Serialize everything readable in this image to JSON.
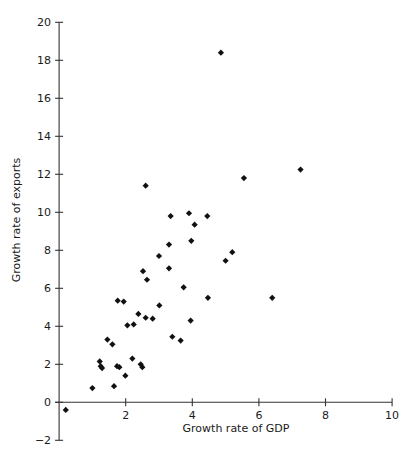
{
  "chart_data": {
    "type": "scatter",
    "title": "",
    "xlabel": "Growth rate of GDP",
    "ylabel": "Growth rate of exports",
    "xlim": [
      0,
      10
    ],
    "ylim": [
      -2,
      20
    ],
    "xticks": [
      0,
      2,
      4,
      6,
      8,
      10
    ],
    "xtick_labels": [
      "",
      "2",
      "4",
      "6",
      "8",
      "10"
    ],
    "yticks": [
      -2,
      0,
      2,
      4,
      6,
      8,
      10,
      12,
      14,
      16,
      18,
      20
    ],
    "ytick_labels": [
      "−2",
      "0",
      "2",
      "4",
      "6",
      "8",
      "10",
      "12",
      "14",
      "16",
      "18",
      "20"
    ],
    "grid": false,
    "legend": null,
    "marker": "diamond",
    "marker_color": "#111111",
    "points": [
      {
        "x": 0.2,
        "y": -0.4
      },
      {
        "x": 1.0,
        "y": 0.75
      },
      {
        "x": 1.22,
        "y": 2.15
      },
      {
        "x": 1.25,
        "y": 1.9
      },
      {
        "x": 1.29,
        "y": 1.8
      },
      {
        "x": 1.45,
        "y": 3.3
      },
      {
        "x": 1.6,
        "y": 3.05
      },
      {
        "x": 1.65,
        "y": 0.85
      },
      {
        "x": 1.74,
        "y": 1.9
      },
      {
        "x": 1.81,
        "y": 1.85
      },
      {
        "x": 1.76,
        "y": 5.35
      },
      {
        "x": 1.94,
        "y": 5.3
      },
      {
        "x": 1.99,
        "y": 1.4
      },
      {
        "x": 2.05,
        "y": 4.05
      },
      {
        "x": 2.24,
        "y": 4.1
      },
      {
        "x": 2.2,
        "y": 2.3
      },
      {
        "x": 2.38,
        "y": 4.65
      },
      {
        "x": 2.45,
        "y": 2.0
      },
      {
        "x": 2.5,
        "y": 1.85
      },
      {
        "x": 2.6,
        "y": 4.45
      },
      {
        "x": 2.81,
        "y": 4.4
      },
      {
        "x": 2.52,
        "y": 6.9
      },
      {
        "x": 2.64,
        "y": 6.45
      },
      {
        "x": 2.6,
        "y": 11.4
      },
      {
        "x": 3.01,
        "y": 5.1
      },
      {
        "x": 3.0,
        "y": 7.7
      },
      {
        "x": 3.35,
        "y": 9.8
      },
      {
        "x": 3.3,
        "y": 8.3
      },
      {
        "x": 3.3,
        "y": 7.05
      },
      {
        "x": 3.4,
        "y": 3.45
      },
      {
        "x": 3.65,
        "y": 3.25
      },
      {
        "x": 3.74,
        "y": 6.05
      },
      {
        "x": 3.9,
        "y": 9.95
      },
      {
        "x": 3.97,
        "y": 8.5
      },
      {
        "x": 4.07,
        "y": 9.35
      },
      {
        "x": 3.95,
        "y": 4.3
      },
      {
        "x": 4.45,
        "y": 9.8
      },
      {
        "x": 4.47,
        "y": 5.5
      },
      {
        "x": 4.86,
        "y": 18.4
      },
      {
        "x": 5.0,
        "y": 7.45
      },
      {
        "x": 5.2,
        "y": 7.9
      },
      {
        "x": 5.55,
        "y": 11.8
      },
      {
        "x": 6.4,
        "y": 5.5
      },
      {
        "x": 7.25,
        "y": 12.25
      }
    ]
  }
}
